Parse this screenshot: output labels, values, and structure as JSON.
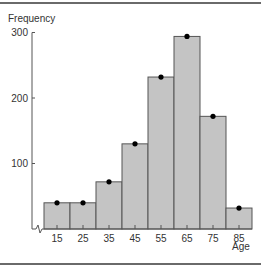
{
  "chart_data": {
    "type": "bar",
    "subtype": "histogram",
    "title": "",
    "ylabel": "Frequency",
    "xlabel": "Age",
    "categories": [
      "15",
      "25",
      "35",
      "45",
      "55",
      "65",
      "75",
      "85"
    ],
    "values": [
      40,
      40,
      72,
      130,
      232,
      294,
      172,
      32
    ],
    "markers": "dot at midpoint of each bar top",
    "y_ticks": [
      100,
      200,
      300
    ],
    "ylim": [
      0,
      300
    ],
    "axis_break": "x-axis origin broken (zigzag)",
    "grid": false,
    "legend": null,
    "colors": {
      "bar_fill": "#c4c4c4",
      "bar_edge": "#555555",
      "marker": "#000000",
      "axis": "#555555"
    }
  }
}
